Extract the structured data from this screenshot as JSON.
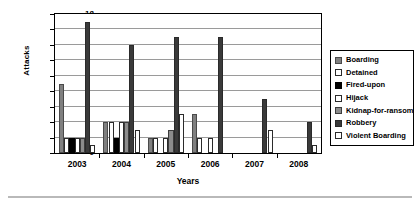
{
  "chart_data": {
    "type": "bar",
    "title": "",
    "xlabel": "Years",
    "ylabel": "Attacks",
    "categories": [
      "2003",
      "2004",
      "2005",
      "2006",
      "2007",
      "2008"
    ],
    "ylim": [
      0,
      18
    ],
    "ytick_step": 2,
    "yticks": [
      "18",
      "16",
      "14",
      "12",
      "10",
      "8",
      "6",
      "4",
      "2",
      "0"
    ],
    "grid": true,
    "legend_position": "right",
    "series": [
      {
        "name": "Boarding",
        "swatch": "gray-hatch",
        "color": "#808080",
        "values": [
          9,
          4,
          2,
          5,
          0,
          0
        ]
      },
      {
        "name": "Detained",
        "swatch": "white",
        "color": "#ffffff",
        "values": [
          2,
          4,
          2,
          2,
          0,
          0
        ]
      },
      {
        "name": "Fired-upon",
        "swatch": "black",
        "color": "#000000",
        "values": [
          2,
          2,
          0,
          0,
          0,
          0
        ]
      },
      {
        "name": "Hijack",
        "swatch": "white",
        "color": "#ffffff",
        "values": [
          2,
          4,
          2,
          2,
          0,
          0
        ]
      },
      {
        "name": "Kidnap-for-ransom",
        "swatch": "gray-hatch",
        "color": "#8c8c8c",
        "values": [
          2,
          4,
          3,
          0,
          0,
          0
        ]
      },
      {
        "name": "Robbery",
        "swatch": "dark-gray",
        "color": "#3a3a3a",
        "values": [
          17,
          14,
          15,
          15,
          7,
          4
        ]
      },
      {
        "name": "Violent Boarding",
        "swatch": "white",
        "color": "#ffffff",
        "values": [
          1,
          3,
          5,
          0,
          3,
          1
        ]
      }
    ]
  },
  "legend": {
    "items": [
      {
        "label": "Boarding"
      },
      {
        "label": "Detained"
      },
      {
        "label": "Fired-upon"
      },
      {
        "label": "Hijack"
      },
      {
        "label": "Kidnap-for-ransom"
      },
      {
        "label": "Robbery"
      },
      {
        "label": "Violent Boarding"
      }
    ]
  }
}
